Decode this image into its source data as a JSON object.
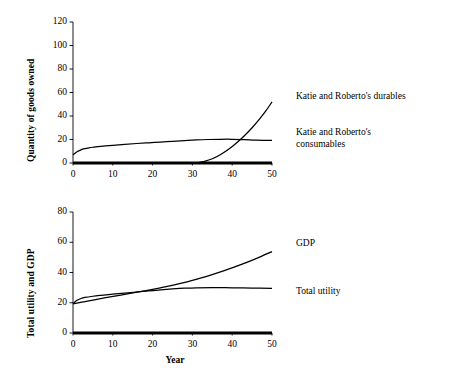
{
  "chart_data": [
    {
      "id": "top",
      "type": "line",
      "title": "",
      "xlabel": "",
      "ylabel": "Quantity of goods owned",
      "xlim": [
        0,
        50
      ],
      "ylim": [
        0,
        120
      ],
      "xticks": [
        0,
        10,
        20,
        30,
        40,
        50
      ],
      "yticks": [
        0,
        20,
        40,
        60,
        80,
        100,
        120
      ],
      "grid": false,
      "legend_position": "right-inline",
      "series": [
        {
          "name": "Katie and Roberto's consumables",
          "label_lines": "Katie and Roberto's\nconsumables",
          "x": [
            0,
            1,
            2,
            3,
            4,
            5,
            7,
            10,
            13,
            16,
            19,
            22,
            25,
            28,
            31,
            34,
            37,
            40,
            43,
            46,
            50
          ],
          "values": [
            7.0,
            9.6,
            11.2,
            12.2,
            12.9,
            13.4,
            14.2,
            15.1,
            15.9,
            16.6,
            17.2,
            17.8,
            18.4,
            19.0,
            19.6,
            20.0,
            20.2,
            20.2,
            19.9,
            19.5,
            19.2
          ]
        },
        {
          "name": "Katie and Roberto's durables",
          "label_lines": "Katie and Roberto's durables",
          "x": [
            0,
            10,
            20,
            28,
            31,
            33,
            35,
            37,
            39,
            41,
            43,
            45,
            47,
            48.5,
            50
          ],
          "values": [
            0.0,
            0.0,
            0.0,
            0.0,
            0.0,
            1.4,
            3.6,
            7.0,
            11.4,
            16.8,
            23.0,
            30.0,
            38.0,
            44.5,
            52.0
          ]
        },
        {
          "name": "baseline",
          "label_lines": "",
          "x": [
            0,
            50
          ],
          "values": [
            0,
            0
          ]
        }
      ]
    },
    {
      "id": "bottom",
      "type": "line",
      "title": "",
      "xlabel": "Year",
      "ylabel": "Total utility and GDP",
      "xlim": [
        0,
        50
      ],
      "ylim": [
        0,
        80
      ],
      "xticks": [
        0,
        10,
        20,
        30,
        40,
        50
      ],
      "yticks": [
        0,
        20,
        40,
        60,
        80
      ],
      "grid": false,
      "legend_position": "right-inline",
      "series": [
        {
          "name": "GDP",
          "label_lines": "GDP",
          "x": [
            0,
            3,
            6,
            9,
            12,
            15,
            18,
            21,
            24,
            27,
            30,
            34,
            38,
            42,
            46,
            50
          ],
          "values": [
            19.2,
            20.8,
            22.3,
            23.7,
            25.1,
            26.5,
            27.9,
            29.4,
            31.0,
            32.8,
            34.8,
            37.8,
            41.2,
            45.0,
            49.2,
            53.8
          ]
        },
        {
          "name": "Total utility",
          "label_lines": "Total utility",
          "x": [
            0,
            1,
            2,
            3,
            5,
            7,
            10,
            13,
            16,
            19,
            22,
            25,
            28,
            31,
            35,
            40,
            45,
            50
          ],
          "values": [
            19.4,
            21.6,
            22.8,
            23.5,
            24.3,
            24.9,
            25.7,
            26.4,
            27.1,
            27.8,
            28.5,
            29.1,
            29.6,
            29.9,
            30.0,
            29.9,
            29.7,
            29.5
          ]
        },
        {
          "name": "baseline",
          "label_lines": "",
          "x": [
            0,
            50
          ],
          "values": [
            0,
            0
          ]
        }
      ]
    }
  ],
  "axes": {
    "top": {
      "ylabel": "Quantity of goods owned",
      "ytick_labels": [
        "0",
        "20",
        "40",
        "60",
        "80",
        "100",
        "120"
      ],
      "xtick_labels": [
        "0",
        "10",
        "20",
        "30",
        "40",
        "50"
      ]
    },
    "bottom": {
      "ylabel": "Total utility and GDP",
      "xlabel": "Year",
      "ytick_labels": [
        "0",
        "20",
        "40",
        "60",
        "80"
      ],
      "xtick_labels": [
        "0",
        "10",
        "20",
        "30",
        "40",
        "50"
      ]
    }
  },
  "annotations": {
    "top_series_1": "Katie and Roberto's durables",
    "top_series_2": "Katie and Roberto's\nconsumables",
    "bottom_series_1": "GDP",
    "bottom_series_2": "Total utility"
  }
}
